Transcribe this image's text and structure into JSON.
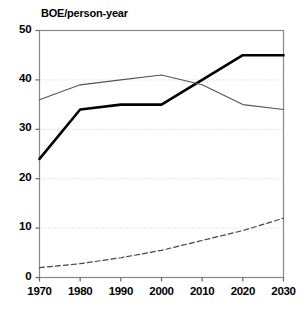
{
  "chart_data": {
    "type": "line",
    "title": "BOE/person-year",
    "xlabel": "",
    "ylabel": "",
    "x": [
      1970,
      1980,
      1990,
      2000,
      2010,
      2020,
      2030
    ],
    "xlim": [
      1970,
      2030
    ],
    "ylim": [
      0,
      50
    ],
    "xticks": [
      "1970",
      "1980",
      "1990",
      "2000",
      "2010",
      "2020",
      "2030"
    ],
    "yticks": [
      "0",
      "10",
      "20",
      "30",
      "40",
      "50"
    ],
    "grid": "horizontal-dotted",
    "legend": "none",
    "series": [
      {
        "name": "thick-solid",
        "style": "solid-thick",
        "color": "#000000",
        "values": [
          24,
          34,
          35,
          35,
          40,
          45,
          45
        ]
      },
      {
        "name": "thin-solid",
        "style": "solid-thin",
        "color": "#555555",
        "values": [
          36,
          39,
          40,
          41,
          39,
          35,
          34
        ]
      },
      {
        "name": "dashed",
        "style": "dashed",
        "color": "#444444",
        "values": [
          2,
          2.8,
          4,
          5.5,
          7.5,
          9.5,
          12
        ]
      }
    ]
  },
  "axes": {
    "frame_color": "#888888",
    "grid_color": "#cccccc"
  }
}
